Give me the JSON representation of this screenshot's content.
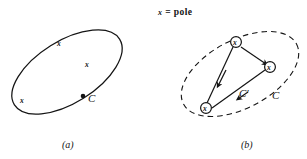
{
  "figure": {
    "legend": {
      "symbol": "x",
      "equals": "=",
      "term": "pole",
      "full_text": "x = pole"
    },
    "panels": [
      {
        "id": "a",
        "caption": "(a)",
        "contour": {
          "name": "C",
          "style": "solid",
          "label": "C",
          "label_point_on_curve": true
        },
        "poles": [
          {
            "mark": "x",
            "x": 60,
            "y": 44
          },
          {
            "mark": "x",
            "x": 88,
            "y": 64
          },
          {
            "mark": "x",
            "x": 23,
            "y": 100
          }
        ]
      },
      {
        "id": "b",
        "caption": "(b)",
        "contour_outer": {
          "name": "C",
          "style": "dashed",
          "label": "C"
        },
        "contour_inner": {
          "name": "C-prime",
          "style": "solid",
          "label": "C'",
          "directed": true
        },
        "poles": [
          {
            "mark": "x",
            "circled": true,
            "x": 236,
            "y": 42
          },
          {
            "mark": "x",
            "circled": true,
            "x": 270,
            "y": 67
          },
          {
            "mark": "x",
            "circled": true,
            "x": 206,
            "y": 108
          }
        ]
      }
    ],
    "colors": {
      "ink": "#141414",
      "background": "#ffffff"
    }
  }
}
